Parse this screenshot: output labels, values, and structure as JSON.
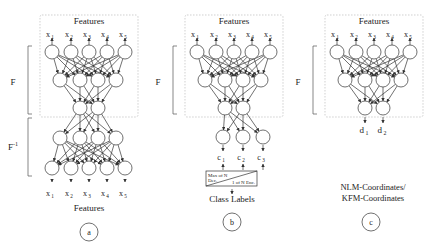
{
  "panels": [
    {
      "id": "a",
      "label": "a",
      "top_title": "Features",
      "inputs": [
        "x",
        "x",
        "x",
        "x",
        "x"
      ],
      "input_subs": [
        "1",
        "2",
        "3",
        "4",
        "5"
      ],
      "outputs": [
        "x",
        "x",
        "x",
        "x",
        "x"
      ],
      "output_subs": [
        "1",
        "2",
        "3",
        "4",
        "5"
      ],
      "bottom_title": "Features",
      "bracket_top": "F",
      "bracket_bottom": "F",
      "bracket_bottom_sup": "-1"
    },
    {
      "id": "b",
      "label": "b",
      "top_title": "Features",
      "inputs": [
        "x",
        "x",
        "x",
        "x",
        "x"
      ],
      "input_subs": [
        "1",
        "2",
        "3",
        "4",
        "5"
      ],
      "outputs": [
        "c",
        "c",
        "c"
      ],
      "output_subs": [
        "1",
        "2",
        "3"
      ],
      "bracket_top": "F",
      "box_top_line1": "Max of N",
      "box_top_line2": "Dec.",
      "box_bottom": "1 of N Enc.",
      "bottom_title": "Class Labels"
    },
    {
      "id": "c",
      "label": "c",
      "top_title": "Features",
      "inputs": [
        "x",
        "x",
        "x",
        "x",
        "x"
      ],
      "input_subs": [
        "1",
        "2",
        "3",
        "4",
        "5"
      ],
      "outputs": [
        "d",
        "d"
      ],
      "output_subs": [
        "1",
        "2"
      ],
      "bracket_top": "F",
      "bottom_line1": "NLM-Coordinates/",
      "bottom_line2": "KFM-Coordinates"
    }
  ]
}
